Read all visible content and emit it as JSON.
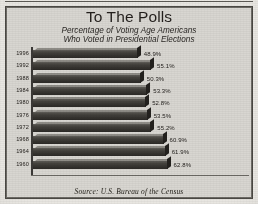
{
  "chart_data": {
    "type": "bar",
    "orientation": "horizontal",
    "title": "To The Polls",
    "subtitle_line1": "Percentage of Voting Age Americans",
    "subtitle_line2": "Who Voted in Presidential Elections",
    "source": "Source:  U.S. Bureau of the Census",
    "xlabel": "",
    "ylabel": "",
    "xlim": [
      0,
      70
    ],
    "grid": false,
    "legend": false,
    "categories": [
      "1996",
      "1992",
      "1988",
      "1984",
      "1980",
      "1976",
      "1972",
      "1968",
      "1964",
      "1960"
    ],
    "values": [
      48.9,
      55.1,
      50.3,
      53.3,
      52.8,
      53.5,
      55.2,
      60.9,
      61.9,
      62.8
    ],
    "value_labels": [
      "48.9%",
      "55.1%",
      "50.3%",
      "53.3%",
      "52.8%",
      "53.5%",
      "55.2%",
      "60.9%",
      "61.9%",
      "62.8%"
    ],
    "bar_color": "#3a3833",
    "bar_highlight_color": "#8e8c86",
    "background_color": "#d8d6d1"
  }
}
